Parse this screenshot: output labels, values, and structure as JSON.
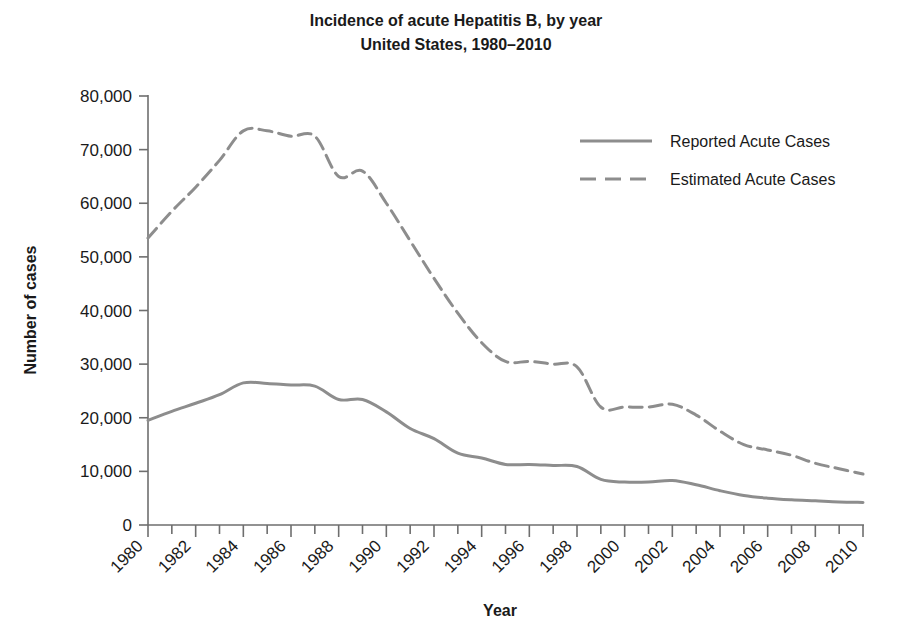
{
  "chart_data": {
    "type": "line",
    "title": "Incidence of acute Hepatitis B, by year",
    "subtitle": "United States, 1980–2010",
    "xlabel": "Year",
    "ylabel": "Number of cases",
    "xlim": [
      1980,
      2010
    ],
    "ylim": [
      0,
      80000
    ],
    "grid": false,
    "legend_position": "top-right",
    "ytick_labels": [
      "80,000",
      "70,000",
      "60,000",
      "50,000",
      "40,000",
      "30,000",
      "20,000",
      "10,000",
      "0"
    ],
    "ytick_values": [
      80000,
      70000,
      60000,
      50000,
      40000,
      30000,
      20000,
      10000,
      0
    ],
    "xtick_labels": [
      "1980",
      "1982",
      "1984",
      "1986",
      "1988",
      "1990",
      "1992",
      "1994",
      "1996",
      "1998",
      "2000",
      "2002",
      "2004",
      "2006",
      "2008",
      "2010"
    ],
    "xtick_values": [
      1980,
      1982,
      1984,
      1986,
      1988,
      1990,
      1992,
      1994,
      1996,
      1998,
      2000,
      2002,
      2004,
      2006,
      2008,
      2010
    ],
    "x": [
      1980,
      1981,
      1982,
      1983,
      1984,
      1985,
      1986,
      1987,
      1988,
      1989,
      1990,
      1991,
      1992,
      1993,
      1994,
      1995,
      1996,
      1997,
      1998,
      1999,
      2000,
      2001,
      2002,
      2003,
      2004,
      2005,
      2006,
      2007,
      2008,
      2009,
      2010
    ],
    "series": [
      {
        "name": "Reported Acute Cases",
        "style": "solid",
        "color": "#8d8d8d",
        "values": [
          19500,
          21200,
          22700,
          24300,
          26500,
          26400,
          26100,
          25900,
          23400,
          23400,
          21100,
          18000,
          16100,
          13400,
          12500,
          11300,
          11300,
          11100,
          10900,
          8500,
          8000,
          8000,
          8300,
          7500,
          6400,
          5500,
          5000,
          4700,
          4500,
          4300,
          4200
        ]
      },
      {
        "name": "Estimated Acute Cases",
        "style": "dashed",
        "color": "#8d8d8d",
        "values": [
          53500,
          58500,
          63000,
          68000,
          73500,
          73500,
          72500,
          72500,
          65000,
          66000,
          60000,
          53000,
          46000,
          39500,
          34000,
          30500,
          30500,
          30000,
          29500,
          22000,
          22000,
          22000,
          22500,
          20500,
          17500,
          15000,
          14000,
          13000,
          11500,
          10500,
          9500
        ]
      }
    ]
  },
  "legend": {
    "items": [
      {
        "label": "Reported Acute Cases",
        "style": "solid"
      },
      {
        "label": "Estimated Acute Cases",
        "style": "dashed"
      }
    ]
  }
}
